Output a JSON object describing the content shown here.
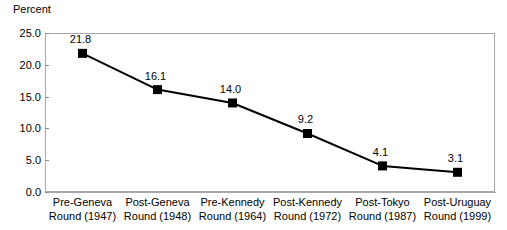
{
  "chart_data": {
    "type": "line",
    "title": "",
    "ylabel": "Percent",
    "xlabel": "",
    "ylim": [
      0.0,
      25.0
    ],
    "yticks": [
      "0.0",
      "5.0",
      "10.0",
      "15.0",
      "20.0",
      "25.0"
    ],
    "ytick_values": [
      0.0,
      5.0,
      10.0,
      15.0,
      20.0,
      25.0
    ],
    "grid": false,
    "legend": "none",
    "marker": "square",
    "marker_color": "#000000",
    "line_color": "#000000",
    "categories": [
      "Pre-Geneva Round (1947)",
      "Post-Geneva Round (1948)",
      "Pre-Kennedy Round (1964)",
      "Post-Kennedy Round (1972)",
      "Post-Tokyo Round (1987)",
      "Post-Uruguay Round (1999)"
    ],
    "category_lines": [
      [
        "Pre-Geneva",
        "Round (1947)"
      ],
      [
        "Post-Geneva",
        "Round (1948)"
      ],
      [
        "Pre-Kennedy",
        "Round (1964)"
      ],
      [
        "Post-Kennedy",
        "Round (1972)"
      ],
      [
        "Post-Tokyo",
        "Round (1987)"
      ],
      [
        "Post-Uruguay",
        "Round (1999)"
      ]
    ],
    "values": [
      21.8,
      16.1,
      14.0,
      9.2,
      4.1,
      3.1
    ],
    "data_labels": [
      "21.8",
      "16.1",
      "14.0",
      "9.2",
      "4.1",
      "3.1"
    ]
  },
  "colors": {
    "plot_border": "#a9a9a9",
    "axis": "#7a7a7a",
    "series": "#000000",
    "background": "#ffffff",
    "text": "#000000"
  }
}
